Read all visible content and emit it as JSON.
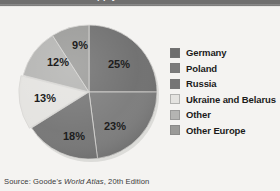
{
  "titlebar": {
    "text": "Percent of world supply"
  },
  "source": {
    "prefix": "Source: Goode's ",
    "italic": "World Atlas",
    "suffix": ", 20th Edition"
  },
  "legend": {
    "items": [
      {
        "label": "Germany",
        "color": "#6e6e6e",
        "swatch_name": "legend-swatch-germany"
      },
      {
        "label": "Poland",
        "color": "#7b7b7b",
        "swatch_name": "legend-swatch-poland"
      },
      {
        "label": "Russia",
        "color": "#757575",
        "swatch_name": "legend-swatch-russia"
      },
      {
        "label": "Ukraine and Belarus",
        "color": "#e4e3e0",
        "swatch_name": "legend-swatch-ukraine-belarus"
      },
      {
        "label": "Other",
        "color": "#b4b4b2",
        "swatch_name": "legend-swatch-other"
      },
      {
        "label": "Other Europe",
        "color": "#9a9a98",
        "swatch_name": "legend-swatch-other-europe"
      }
    ]
  },
  "chart_data": {
    "type": "pie",
    "title": "",
    "subtitle": "",
    "xlabel": "",
    "ylabel": "",
    "legend_position": "right",
    "grid": false,
    "start_angle_deg": 0,
    "direction": "clockwise",
    "value_unit": "percent",
    "total": 100,
    "categories": [
      "Germany",
      "Poland",
      "Russia",
      "Ukraine and Belarus",
      "Other",
      "Other Europe"
    ],
    "values": [
      25,
      23,
      18,
      13,
      12,
      9
    ],
    "labels": [
      "25%",
      "23%",
      "18%",
      "13%",
      "12%",
      "9%"
    ],
    "colors": [
      "#6e6e6e",
      "#7b7b7b",
      "#757575",
      "#e4e3e0",
      "#b4b4b2",
      "#9a9a98"
    ],
    "exploded": [
      false,
      false,
      false,
      true,
      false,
      false
    ],
    "slices": [
      {
        "category": "Germany",
        "value": 25,
        "label": "25%",
        "color": "#6e6e6e",
        "start_deg": 0,
        "end_deg": 90,
        "label_x": 103,
        "label_y": 46
      },
      {
        "category": "Poland",
        "value": 23,
        "label": "23%",
        "color": "#7b7b7b",
        "start_deg": 90,
        "end_deg": 172.8,
        "label_x": 99,
        "label_y": 108
      },
      {
        "category": "Russia",
        "value": 18,
        "label": "18%",
        "color": "#757575",
        "start_deg": 172.8,
        "end_deg": 237.6,
        "label_x": 58,
        "label_y": 118
      },
      {
        "category": "Ukraine and Belarus",
        "value": 13,
        "label": "13%",
        "color": "#e4e3e0",
        "start_deg": 237.6,
        "end_deg": 284.4,
        "label_x": 29,
        "label_y": 80
      },
      {
        "category": "Other",
        "value": 12,
        "label": "12%",
        "color": "#b4b4b2",
        "start_deg": 284.4,
        "end_deg": 327.6,
        "label_x": 42,
        "label_y": 44
      },
      {
        "category": "Other Europe",
        "value": 9,
        "label": "9%",
        "color": "#9a9a98",
        "start_deg": 327.6,
        "end_deg": 360,
        "label_x": 64,
        "label_y": 27
      }
    ]
  }
}
